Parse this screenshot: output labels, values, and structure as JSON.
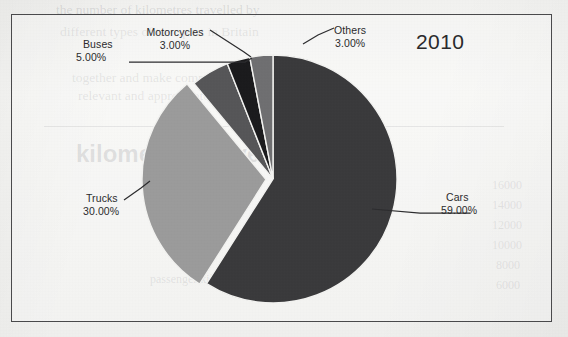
{
  "frame": {
    "border_color": "#4a4a4c",
    "background_color": "#f4f4f2"
  },
  "title": {
    "year": "2010"
  },
  "labels": {
    "cars_name": "Cars",
    "cars_value": "59.00%",
    "trucks_name": "Trucks",
    "trucks_value": "30.00%",
    "buses_name": "Buses",
    "buses_value": "5.00%",
    "motorcycles_name": "Motorcycles",
    "motorcycles_value": "3.00%",
    "others_name": "Others",
    "others_value": "3.00%"
  },
  "background_bleed": {
    "line1": "the number of kilometres travelled by",
    "line2": "different types of transport in Britain",
    "line3": "together and make comparisons",
    "line4": "relevant and appropriate.",
    "heading": "kilometres travelled by",
    "tick1": "16000",
    "tick2": "14000",
    "tick3": "12000",
    "tick4": "10000",
    "tick5": "8000",
    "tick6": "6000",
    "caption": "passenger kilometres"
  },
  "chart_data": {
    "type": "pie",
    "title": "2010",
    "categories": [
      "Cars",
      "Trucks",
      "Buses",
      "Motorcycles",
      "Others"
    ],
    "values": [
      59.0,
      30.0,
      5.0,
      3.0,
      3.0
    ],
    "value_labels": [
      "59.00%",
      "30.00%",
      "5.00%",
      "3.00%",
      "3.00%"
    ],
    "unit": "%",
    "colors": [
      "#3a3a3c",
      "#9b9b9b",
      "#565658",
      "#1b1b1d",
      "#6f6f71"
    ],
    "start_angle_deg": 0,
    "direction": "clockwise",
    "exploded_slice": "Trucks",
    "legend": "none",
    "labels_position": "outside-with-leader-lines",
    "grid": false
  }
}
